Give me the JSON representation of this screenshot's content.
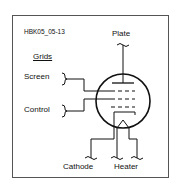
{
  "figure": {
    "id_label": "HBK05_05-13",
    "labels": {
      "plate": "Plate",
      "grids_heading": "Grids",
      "screen": "Screen",
      "control": "Control",
      "cathode": "Cathode",
      "heater": "Heater"
    },
    "colors": {
      "stroke": "#111111",
      "frame": "#555555",
      "background": "#ffffff"
    }
  }
}
